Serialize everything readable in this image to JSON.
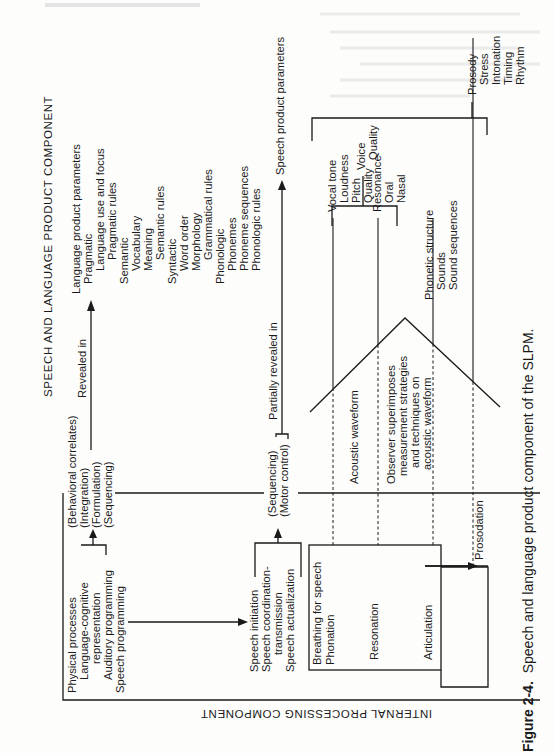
{
  "figure": {
    "caption_label": "Figure 2-4.",
    "caption_text": "Speech and language product component of the SLPM.",
    "title_top": "SPEECH AND LANGUAGE PRODUCT COMPONENT",
    "title_bottom": "INTERNAL PROCESSING COMPONENT"
  },
  "language_params": {
    "heading": "Language product parameters",
    "lines": [
      "Pragmatic",
      "Language use and focus",
      "Pragmatic rules",
      "Semantic",
      "Vocabulary",
      "Meaning",
      "Semantic rules",
      "Syntactic",
      "Word order",
      "Morphology",
      "Grammatical rules",
      "Phonologic",
      "Phonemes",
      "Phoneme sequences",
      "Phonologic rules"
    ]
  },
  "speech_params": {
    "heading": "Speech product parameters"
  },
  "arrows": {
    "revealed_in": "Revealed in",
    "partially_revealed_in": "Partially revealed in"
  },
  "behavioral": {
    "lines": [
      "(Behavioral correlates)",
      "(Integration)",
      "(Formulation)",
      "(Sequencing)"
    ]
  },
  "motor": {
    "lines": [
      "(Sequencing)",
      "(Motor control)"
    ]
  },
  "internal_processes": {
    "lines": [
      "Physical processes",
      "Language-cognitive",
      "representation",
      "Auditory programming",
      "Speech programming"
    ]
  },
  "speech_stages": {
    "lines": [
      "Speech initiation",
      "Speech coordination-",
      "transmission",
      "Speech actualization"
    ]
  },
  "physiology": {
    "breathing": "Breathing for speech",
    "phonation": "Phonation",
    "resonation": "Resonation",
    "articulation": "Articulation",
    "prosodation": "Prosodation"
  },
  "waveform": {
    "acoustic": "Acoustic waveform",
    "observer_lines": [
      "Observer superimposes",
      "measurement strategies",
      "and techniques on",
      "acoustic waveform"
    ]
  },
  "vocal": {
    "lines": [
      "Vocal tone",
      "Loudness",
      "Pitch",
      "Quality",
      "Resonance",
      "Oral",
      "Nasal"
    ]
  },
  "voice_quality": {
    "lines": [
      "Voice",
      "Quality"
    ]
  },
  "phonetic": {
    "lines": [
      "Phonetic structure",
      "Sounds",
      "Sound sequences"
    ]
  },
  "prosody": {
    "lines": [
      "Prosody",
      "Stress",
      "Intonation",
      "Timing",
      "Rhythm"
    ]
  }
}
